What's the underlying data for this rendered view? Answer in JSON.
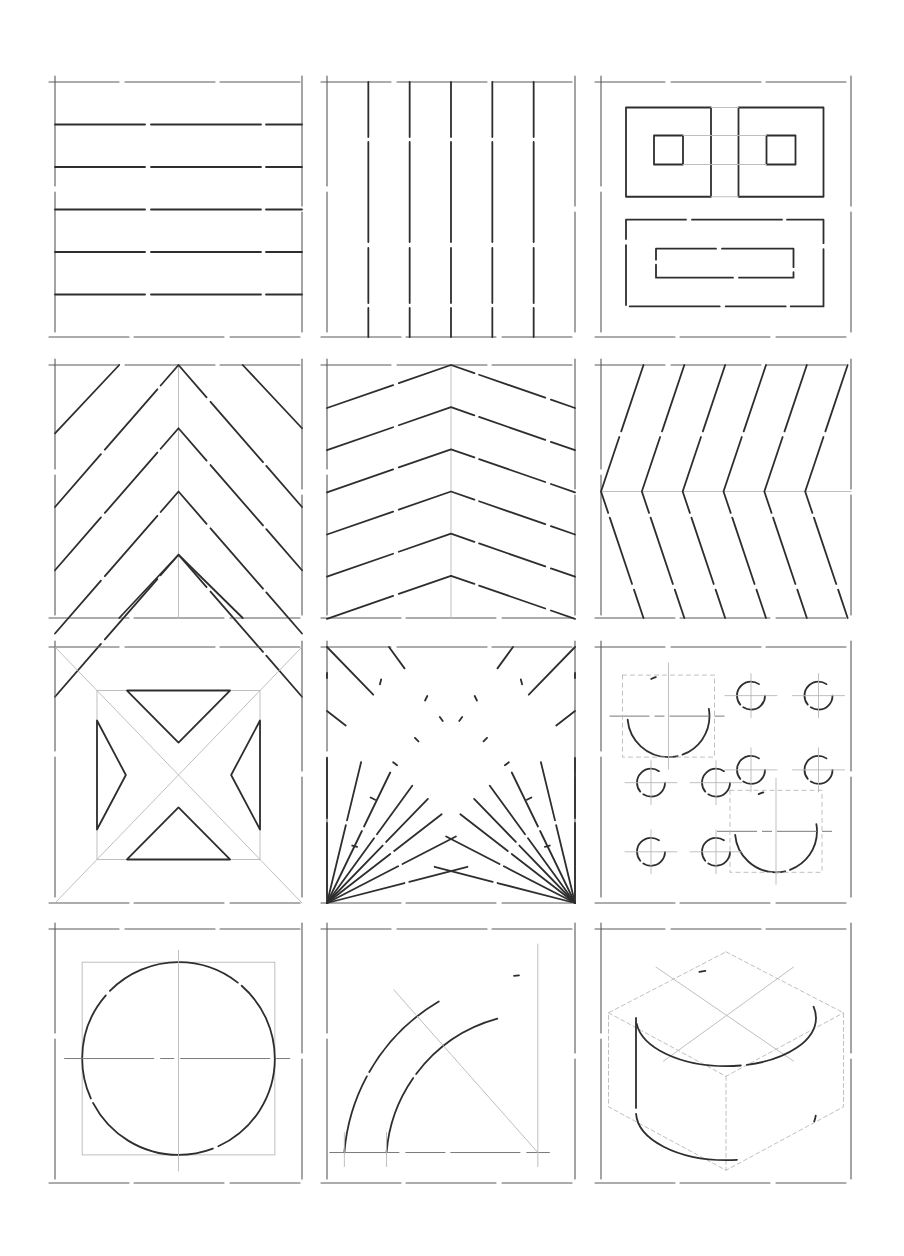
{
  "sheet": {
    "title": "",
    "background": "#ffffff",
    "ink_color": "#2e2e2e",
    "guide_color": "#b8b8b8",
    "grid": {
      "rows": 4,
      "cols": 3
    },
    "columns_x": [
      [
        55,
        302
      ],
      [
        327,
        575
      ],
      [
        601,
        851
      ]
    ],
    "rows_y": [
      [
        82,
        337
      ],
      [
        365,
        618
      ],
      [
        647,
        903
      ],
      [
        929,
        1183
      ]
    ]
  },
  "panels": [
    {
      "id": "horizontal-lines",
      "row": 0,
      "col": 0,
      "description": "Five evenly spaced horizontal lines"
    },
    {
      "id": "vertical-lines",
      "row": 0,
      "col": 1,
      "description": "Five evenly spaced vertical lines"
    },
    {
      "id": "nested-rectangles",
      "row": 0,
      "col": 2,
      "description": "Two squares with inner squares above a long rectangle with inner rectangle"
    },
    {
      "id": "chevron-45",
      "row": 1,
      "col": 0,
      "description": "Steep chevron pattern around a central vertical axis"
    },
    {
      "id": "chevron-shallow",
      "row": 1,
      "col": 1,
      "description": "Shallow chevron pattern around a central vertical axis"
    },
    {
      "id": "chevron-sideways",
      "row": 1,
      "col": 2,
      "description": "Sideways chevrons pointing left around a horizontal axis"
    },
    {
      "id": "diagonal-x-frame",
      "row": 2,
      "col": 0,
      "description": "Square frame with crossing diagonal bands forming four triangles"
    },
    {
      "id": "radiating-lines",
      "row": 2,
      "col": 1,
      "description": "Lines radiating from both bottom corners"
    },
    {
      "id": "circle-sizes",
      "row": 2,
      "col": 2,
      "description": "Two large circles and eight small circles with center lines"
    },
    {
      "id": "circle-in-square",
      "row": 3,
      "col": 0,
      "description": "Large circle inscribed in a construction square with center lines"
    },
    {
      "id": "quarter-arc-band",
      "row": 3,
      "col": 1,
      "description": "Two concentric quarter arcs with a radial construction line"
    },
    {
      "id": "isometric-cylinder",
      "row": 3,
      "col": 2,
      "description": "Cylinder drawn inside an isometric hexagon guide"
    }
  ]
}
